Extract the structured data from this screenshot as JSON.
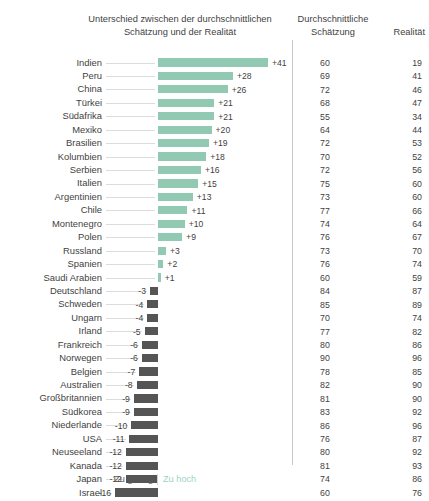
{
  "header": {
    "diff_title": "Unterschied zwischen der durchschnittlichen Schätzung und der Realität",
    "estimate_title": "Durchschnittliche Schätzung",
    "reality_title": "Realität"
  },
  "legend": {
    "too_low": "Zu gering",
    "too_high": "Zu hoch"
  },
  "chart_data": {
    "type": "bar",
    "title": "Unterschied zwischen der durchschnittlichen Schätzung und der Realität",
    "xlabel": "",
    "ylabel": "",
    "orientation": "horizontal",
    "diverging": true,
    "zero_line_px": 158,
    "px_per_unit": 2.68,
    "xlim": [
      -16,
      41
    ],
    "grid": false,
    "legend_position": "bottom",
    "colors": {
      "positive": "#91c9b2",
      "negative": "#555555",
      "text": "#3f3f3f",
      "leader_line": "#dcdcdc",
      "separator": "#c9c9c9"
    },
    "columns": [
      "Land",
      "Unterschied",
      "Durchschnittliche Schätzung",
      "Realität"
    ],
    "categories": [
      "Indien",
      "Peru",
      "China",
      "Türkei",
      "Südafrika",
      "Mexiko",
      "Brasilien",
      "Kolumbien",
      "Serbien",
      "Italien",
      "Argentinien",
      "Chile",
      "Montenegro",
      "Polen",
      "Russland",
      "Spanien",
      "Saudi Arabien",
      "Deutschland",
      "Schweden",
      "Ungarn",
      "Irland",
      "Frankreich",
      "Norwegen",
      "Belgien",
      "Australien",
      "Großbritannien",
      "Südkorea",
      "Niederlande",
      "USA",
      "Neuseeland",
      "Kanada",
      "Japan",
      "Israel"
    ],
    "series": [
      {
        "name": "Unterschied",
        "values": [
          41,
          28,
          26,
          21,
          21,
          20,
          19,
          18,
          16,
          15,
          13,
          11,
          10,
          9,
          3,
          2,
          1,
          -3,
          -4,
          -4,
          -5,
          -6,
          -6,
          -7,
          -8,
          -9,
          -9,
          -10,
          -11,
          -12,
          -12,
          -12,
          -16
        ]
      },
      {
        "name": "Durchschnittliche Schätzung",
        "values": [
          60,
          69,
          72,
          68,
          55,
          64,
          72,
          70,
          72,
          75,
          73,
          77,
          74,
          76,
          73,
          76,
          60,
          84,
          85,
          70,
          77,
          80,
          90,
          78,
          82,
          81,
          83,
          86,
          76,
          80,
          81,
          74,
          60
        ]
      },
      {
        "name": "Realität",
        "values": [
          19,
          41,
          46,
          47,
          34,
          44,
          53,
          52,
          56,
          60,
          60,
          66,
          64,
          67,
          70,
          74,
          59,
          87,
          89,
          74,
          82,
          86,
          96,
          85,
          90,
          90,
          92,
          96,
          87,
          92,
          93,
          86,
          76
        ]
      }
    ],
    "value_labels": [
      "+41",
      "+28",
      "+26",
      "+21",
      "+21",
      "+20",
      "+19",
      "+18",
      "+16",
      "+15",
      "+13",
      "+11",
      "+10",
      "+9",
      "+3",
      "+2",
      "+1",
      "-3",
      "-4",
      "-4",
      "-5",
      "-6",
      "-6",
      "-7",
      "-8",
      "-9",
      "-9",
      "-10",
      "-11",
      "-12",
      "-12",
      "-12",
      "-16"
    ]
  }
}
